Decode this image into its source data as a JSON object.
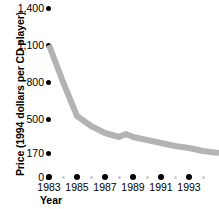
{
  "chart_data": {
    "type": "line",
    "title": "",
    "xlabel": "Year",
    "ylabel": "Price (1994 dollars per CD player)",
    "x": [
      1983,
      1984,
      1985,
      1986,
      1987,
      1988,
      1989,
      1990,
      1991,
      1992,
      1993,
      1994
    ],
    "values": [
      1100,
      800,
      480,
      400,
      350,
      330,
      345,
      320,
      290,
      260,
      210,
      170
    ],
    "series": [
      {
        "name": "Price per CD player",
        "values": [
          1100,
          800,
          480,
          400,
          350,
          330,
          345,
          320,
          290,
          260,
          210,
          170
        ]
      }
    ],
    "xlim": [
      1983,
      1994
    ],
    "ylim": [
      0,
      1400
    ],
    "grid": false,
    "legend": false,
    "line_color": "#b3b3b3",
    "marker_color": "#000000",
    "y_ticks": [
      {
        "label": "1,400",
        "value": 1400,
        "py": 8
      },
      {
        "label": "1,100",
        "value": 1100,
        "py": 45
      },
      {
        "label": "800",
        "value": 800,
        "py": 82
      },
      {
        "label": "500",
        "value": 500,
        "py": 119
      },
      {
        "label": "170",
        "value": 170,
        "py": 153
      },
      {
        "label": "0",
        "value": 0,
        "py": 177
      }
    ],
    "x_ticks_major": [
      {
        "label": "1983",
        "value": 1983,
        "px": 49
      },
      {
        "label": "1985",
        "value": 1985,
        "px": 77
      },
      {
        "label": "1987",
        "value": 1987,
        "px": 105
      },
      {
        "label": "1989",
        "value": 1989,
        "px": 133
      },
      {
        "label": "1991",
        "value": 1991,
        "px": 161
      },
      {
        "label": "1993",
        "value": 1993,
        "px": 189
      }
    ],
    "x_ticks_minor": [
      {
        "value": 1984,
        "px": 63
      },
      {
        "value": 1986,
        "px": 91
      },
      {
        "value": 1988,
        "px": 119
      },
      {
        "value": 1990,
        "px": 147
      },
      {
        "value": 1992,
        "px": 175
      },
      {
        "value": 1994,
        "px": 203
      }
    ],
    "line_path_points": "49,45 63,82 77,116 91,126 105,133 119,137 126,134 133,137 147,140 161,143 175,146 189,148 203,151 219,153"
  }
}
